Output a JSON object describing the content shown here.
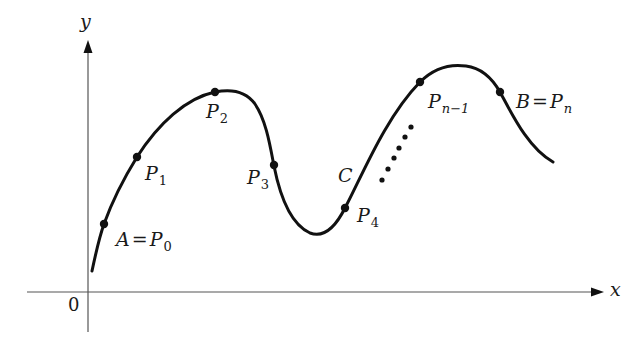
{
  "diagram": {
    "type": "curve-with-partition-points",
    "colors": {
      "ink": "#111111",
      "axis": "#555555",
      "background": "#ffffff"
    },
    "axes": {
      "x_label": "x",
      "y_label": "y",
      "origin_label": "0"
    },
    "curve": {
      "name": "C",
      "label": "C"
    },
    "points": [
      {
        "id": "P0",
        "base": "P",
        "sub": "0",
        "prefix": "A",
        "x": 104,
        "y": 224
      },
      {
        "id": "P1",
        "base": "P",
        "sub": "1",
        "x": 137,
        "y": 157
      },
      {
        "id": "P2",
        "base": "P",
        "sub": "2",
        "x": 215,
        "y": 92
      },
      {
        "id": "P3",
        "base": "P",
        "sub": "3",
        "x": 274,
        "y": 166
      },
      {
        "id": "P4",
        "base": "P",
        "sub": "4",
        "x": 345,
        "y": 208
      },
      {
        "id": "Pn-1",
        "base": "P",
        "sub": "n−1",
        "x": 420,
        "y": 82
      },
      {
        "id": "Pn",
        "base": "P",
        "sub": "n",
        "prefix": "B",
        "x": 500,
        "y": 92
      }
    ],
    "ellipsis_dots": 6,
    "labels": {
      "p0_prefix": "A",
      "p0_eq": "=",
      "p0_base": "P",
      "p0_sub": "0",
      "p1_base": "P",
      "p1_sub": "1",
      "p2_base": "P",
      "p2_sub": "2",
      "p3_base": "P",
      "p3_sub": "3",
      "p4_base": "P",
      "p4_sub": "4",
      "pn1_base": "P",
      "pn1_sub": "n−1",
      "pn_prefix": "B",
      "pn_eq": "=",
      "pn_base": "P",
      "pn_sub": "n"
    }
  }
}
